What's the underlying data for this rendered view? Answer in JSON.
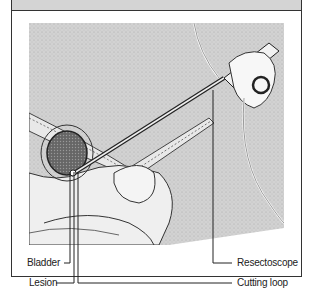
{
  "figure": {
    "labels": [
      {
        "id": "bladder",
        "text": "Bladder"
      },
      {
        "id": "lesion",
        "text": "Lesion"
      },
      {
        "id": "resectoscope",
        "text": "Resectoscope"
      },
      {
        "id": "cutting_loop",
        "text": "Cutting loop"
      }
    ]
  },
  "colors": {
    "header_band": "#d4d4d4",
    "border": "#333333",
    "illustration_bg": "#cfcfcf"
  }
}
